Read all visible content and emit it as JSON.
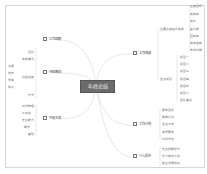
{
  "mindmap": {
    "center": "年终总结",
    "branches": [
      {
        "label": "工作回顾",
        "side": "left",
        "x": 43,
        "y": 38
      },
      {
        "label": "经验教训",
        "side": "left",
        "x": 43,
        "y": 71
      },
      {
        "label": "不足之处",
        "side": "left",
        "x": 43,
        "y": 117
      },
      {
        "label": "工作成果",
        "side": "right",
        "x": 133,
        "y": 52
      },
      {
        "label": "工作计划",
        "side": "right",
        "x": 133,
        "y": 123
      },
      {
        "label": "个人提升",
        "side": "right",
        "x": 133,
        "y": 155
      }
    ],
    "left_sub": {
      "review": [
        "目标",
        "完成情况"
      ],
      "lessons": [
        "经验总结",
        "方法"
      ],
      "lessons_detail": [
        "沟通",
        "协作",
        "效率",
        "执行"
      ],
      "shortcomings": [
        "时间管理",
        "计划性",
        "专业能力",
        "细节",
        "其他"
      ]
    },
    "right_sub": {
      "achievements_group1_label": "主要业绩指标完成",
      "achievements_group1": [
        "业绩目标",
        "完成率",
        "增长",
        "客户数",
        "回款率",
        "成本控制",
        "市场份额"
      ],
      "achievements_group2_label": "重点项目",
      "achievements_group2": [
        "项目一",
        "项目二",
        "项目三",
        "项目四",
        "项目五",
        "项目六",
        "团队建设"
      ],
      "plan": [
        "明年目标",
        "季度计划",
        "重点工作",
        "资源需求",
        "时间节点"
      ],
      "growth": [
        "专业技能提升",
        "学习培训计划",
        "职业发展规划"
      ]
    }
  }
}
